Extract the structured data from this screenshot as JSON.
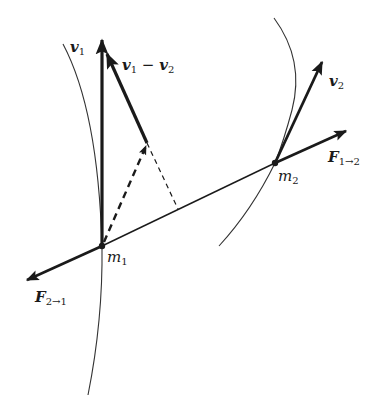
{
  "figure": {
    "colors": {
      "ink": "#1a1a1a",
      "background": "#ffffff"
    }
  },
  "labels": {
    "v1": {
      "main": "v",
      "sub": "1"
    },
    "v1_minus_v2": {
      "main1": "v",
      "sub1": "1",
      "op": " − ",
      "main2": "v",
      "sub2": "2"
    },
    "v2": {
      "main": "v",
      "sub": "2"
    },
    "F12": {
      "main": "F",
      "sub": "1→2"
    },
    "F21": {
      "main": "F",
      "sub": "2→1"
    },
    "m1": {
      "main": "m",
      "sub": "1"
    },
    "m2": {
      "main": "m",
      "sub": "2"
    }
  },
  "points": {
    "m1": [
      102,
      246
    ],
    "m2": [
      275,
      163
    ]
  }
}
